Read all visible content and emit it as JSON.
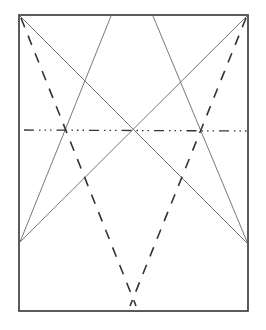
{
  "diagram": {
    "kind": "geometric construction",
    "background": "#ffffff",
    "stroke_color": "#333333",
    "frame": {
      "x1": 19,
      "y1": 15,
      "x2": 248,
      "y2": 311
    },
    "thin_lines": [
      {
        "name": "diagonal-topleft-to-right",
        "x1": 19,
        "y1": 15,
        "x2": 248,
        "y2": 244
      },
      {
        "name": "diagonal-topright-to-left",
        "x1": 248,
        "y1": 15,
        "x2": 20,
        "y2": 242
      },
      {
        "name": "line-top-left-point-to-left",
        "x1": 111,
        "y1": 16,
        "x2": 20,
        "y2": 242
      },
      {
        "name": "line-top-right-point-to-right",
        "x1": 153,
        "y1": 16,
        "x2": 248,
        "y2": 244
      }
    ],
    "dashed_lines": [
      {
        "name": "dashed-left-to-bottom",
        "x1": 21,
        "y1": 18,
        "x2": 136,
        "y2": 306
      },
      {
        "name": "dashed-right-to-bottom",
        "x1": 246,
        "y1": 18,
        "x2": 130,
        "y2": 306
      }
    ],
    "dash_dot_line": {
      "x1": 24,
      "y1": 130,
      "x2": 248,
      "y2": 131
    }
  }
}
